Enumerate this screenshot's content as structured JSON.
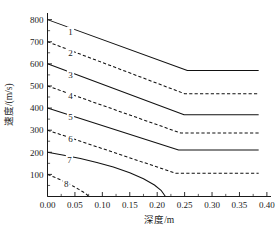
{
  "chart_data": {
    "type": "line",
    "title": "",
    "xlabel": "深度/m",
    "ylabel": "速度/(m/s)",
    "xlim": [
      0.0,
      0.4075
    ],
    "ylim": [
      0,
      830
    ],
    "grid": false,
    "legend_position": "inline-curve-labels",
    "xticks": [
      "0.00",
      "0.05",
      "0.10",
      "0.15",
      "0.20",
      "0.25",
      "0.30",
      "0.35",
      "0.40"
    ],
    "xtick_values": [
      0.0,
      0.05,
      0.1,
      0.15,
      0.2,
      0.25,
      0.3,
      0.35,
      0.4
    ],
    "yticks": [
      "100",
      "200",
      "300",
      "400",
      "500",
      "600",
      "700",
      "800"
    ],
    "ytick_values": [
      100,
      200,
      300,
      400,
      500,
      600,
      700,
      800
    ],
    "minor_ticks": true,
    "series": [
      {
        "name": "1",
        "label": "1",
        "style": "solid",
        "color": "#111111",
        "start_value": 800,
        "plateau_value": 570,
        "knee_x": 0.255,
        "end_x": 0.385,
        "x": [
          0.0,
          0.255,
          0.385
        ],
        "values": [
          800,
          570,
          570
        ]
      },
      {
        "name": "2",
        "label": "2",
        "style": "dashed",
        "color": "#111111",
        "start_value": 700,
        "plateau_value": 465,
        "knee_x": 0.25,
        "end_x": 0.385,
        "x": [
          0.0,
          0.25,
          0.385
        ],
        "values": [
          700,
          465,
          465
        ]
      },
      {
        "name": "3",
        "label": "3",
        "style": "solid",
        "color": "#111111",
        "start_value": 600,
        "plateau_value": 370,
        "knee_x": 0.249,
        "end_x": 0.385,
        "x": [
          0.0,
          0.249,
          0.385
        ],
        "values": [
          600,
          370,
          370
        ]
      },
      {
        "name": "4",
        "label": "4",
        "style": "dashed",
        "color": "#111111",
        "start_value": 500,
        "plateau_value": 287,
        "knee_x": 0.243,
        "end_x": 0.385,
        "x": [
          0.0,
          0.243,
          0.385
        ],
        "values": [
          500,
          287,
          287
        ]
      },
      {
        "name": "5",
        "label": "5",
        "style": "solid",
        "color": "#111111",
        "start_value": 400,
        "plateau_value": 210,
        "knee_x": 0.239,
        "end_x": 0.385,
        "x": [
          0.0,
          0.239,
          0.385
        ],
        "values": [
          400,
          210,
          210
        ]
      },
      {
        "name": "6",
        "label": "6",
        "style": "dashed",
        "color": "#111111",
        "start_value": 300,
        "plateau_value": 105,
        "knee_x": 0.234,
        "end_x": 0.385,
        "x": [
          0.0,
          0.234,
          0.385
        ],
        "values": [
          300,
          105,
          105
        ]
      },
      {
        "name": "7",
        "label": "7",
        "style": "solid",
        "color": "#111111",
        "start_value": 200,
        "plateau_value": 0,
        "knee_x": 0.215,
        "end_x": 0.215,
        "x": [
          0.0,
          0.03,
          0.06,
          0.09,
          0.12,
          0.15,
          0.175,
          0.195,
          0.207,
          0.215
        ],
        "values": [
          200,
          187,
          172,
          154,
          133,
          107,
          80,
          52,
          28,
          0
        ]
      },
      {
        "name": "8",
        "label": "8",
        "style": "dashed",
        "color": "#111111",
        "start_value": 100,
        "plateau_value": 0,
        "knee_x": 0.075,
        "end_x": 0.075,
        "x": [
          0.0,
          0.012,
          0.024,
          0.036,
          0.048,
          0.058,
          0.066,
          0.072,
          0.075
        ],
        "values": [
          100,
          88,
          75,
          61,
          45,
          31,
          19,
          8,
          0
        ]
      }
    ],
    "curve_label_positions": [
      {
        "label": "1",
        "x": 0.042,
        "y": 745
      },
      {
        "label": "2",
        "x": 0.042,
        "y": 648
      },
      {
        "label": "3",
        "x": 0.042,
        "y": 551
      },
      {
        "label": "4",
        "x": 0.042,
        "y": 455
      },
      {
        "label": "5",
        "x": 0.042,
        "y": 358
      },
      {
        "label": "6",
        "x": 0.042,
        "y": 262
      },
      {
        "label": "7",
        "x": 0.04,
        "y": 166
      },
      {
        "label": "8",
        "x": 0.034,
        "y": 58
      }
    ]
  }
}
